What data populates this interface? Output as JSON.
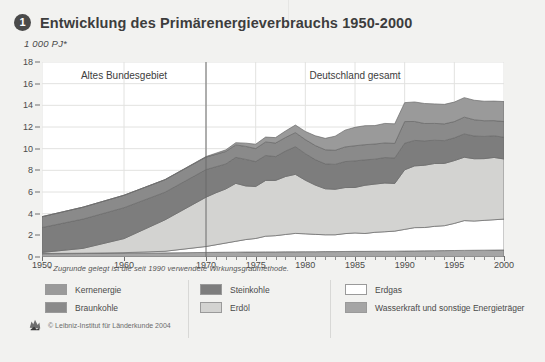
{
  "header": {
    "badge": "1",
    "title": "Entwicklung des Primärenergieverbrauchs 1950-2000",
    "unit": "1 000 PJ*"
  },
  "footnote": "* Zugrunde gelegt ist die seit 1990 verwendete Wirkungsgradmethode.",
  "footer": {
    "copyright": "© Leibniz-Institut für Länderkunde 2004",
    "logo_icon": "leibniz-logo-icon"
  },
  "legend": {
    "columns": [
      {
        "left": 45,
        "items": [
          {
            "label": "Kernenergie",
            "color": "#9a9a9a"
          },
          {
            "label": "Braunkohle",
            "color": "#8a8a8a"
          }
        ]
      },
      {
        "left": 200,
        "items": [
          {
            "label": "Steinkohle",
            "color": "#7d7d7d"
          },
          {
            "label": "Erdöl",
            "color": "#d3d3d1"
          }
        ]
      },
      {
        "left": 345,
        "items": [
          {
            "label": "Erdgas",
            "color": "#ffffff"
          },
          {
            "label": "Wasserkraft und sonstige Energieträger",
            "color": "#a5a5a5"
          }
        ]
      }
    ],
    "divider_x": [
      188,
      330
    ]
  },
  "chart_data": {
    "type": "area",
    "title": "Entwicklung des Primärenergieverbrauchs 1950-2000",
    "subtitle": "",
    "xlabel": "",
    "ylabel": "1 000 PJ*",
    "ylim": [
      0,
      18
    ],
    "ytick_step": 2,
    "yticks": [
      0,
      2,
      4,
      6,
      8,
      10,
      12,
      14,
      16,
      18
    ],
    "grid": true,
    "legend_position": "bottom",
    "stacked": true,
    "annotations": [
      {
        "text": "Altes Bundesgebiet",
        "x": 1960,
        "y": 16.8
      },
      {
        "text": "Deutschland gesamt",
        "x": 1985,
        "y": 16.8
      },
      {
        "text": "divider",
        "x": 1970,
        "type": "vline"
      }
    ],
    "x_axis_note": "piecewise scale: 1950-1970 compressed, 1970-2000 annual ticks",
    "xticks_major": [
      1950,
      1960,
      1970,
      1975,
      1980,
      1985,
      1990,
      1995,
      2000
    ],
    "x": [
      1950,
      1955,
      1960,
      1965,
      1970,
      1971,
      1972,
      1973,
      1974,
      1975,
      1976,
      1977,
      1978,
      1979,
      1980,
      1981,
      1982,
      1983,
      1984,
      1985,
      1986,
      1987,
      1988,
      1989,
      1990,
      1991,
      1992,
      1993,
      1994,
      1995,
      1996,
      1997,
      1998,
      1999,
      2000
    ],
    "series": [
      {
        "name": "Wasserkraft und sonstige Energieträger",
        "color": "#a5a5a5",
        "values": [
          0.3,
          0.32,
          0.35,
          0.38,
          0.42,
          0.43,
          0.44,
          0.45,
          0.46,
          0.46,
          0.47,
          0.47,
          0.48,
          0.48,
          0.49,
          0.49,
          0.5,
          0.5,
          0.51,
          0.52,
          0.52,
          0.53,
          0.53,
          0.54,
          0.55,
          0.56,
          0.57,
          0.58,
          0.59,
          0.6,
          0.61,
          0.62,
          0.63,
          0.64,
          0.65
        ]
      },
      {
        "name": "Erdgas",
        "color": "#ffffff",
        "values": [
          0.02,
          0.03,
          0.05,
          0.15,
          0.55,
          0.7,
          0.85,
          1.0,
          1.15,
          1.25,
          1.45,
          1.5,
          1.6,
          1.7,
          1.65,
          1.6,
          1.55,
          1.55,
          1.65,
          1.7,
          1.65,
          1.75,
          1.8,
          1.85,
          2.0,
          2.15,
          2.15,
          2.25,
          2.3,
          2.5,
          2.75,
          2.7,
          2.75,
          2.8,
          2.85
        ]
      },
      {
        "name": "Erdöl",
        "color": "#d3d3d1",
        "values": [
          0.1,
          0.45,
          1.3,
          2.9,
          4.55,
          4.8,
          5.0,
          5.35,
          4.95,
          4.8,
          5.15,
          5.1,
          5.35,
          5.45,
          4.95,
          4.55,
          4.25,
          4.2,
          4.25,
          4.2,
          4.45,
          4.45,
          4.5,
          4.4,
          5.5,
          5.7,
          5.75,
          5.8,
          5.75,
          5.8,
          5.85,
          5.75,
          5.7,
          5.75,
          5.55
        ]
      },
      {
        "name": "Steinkohle",
        "color": "#7d7d7d",
        "values": [
          2.3,
          2.7,
          2.85,
          2.55,
          2.55,
          2.4,
          2.3,
          2.4,
          2.45,
          2.3,
          2.3,
          2.2,
          2.35,
          2.55,
          2.45,
          2.35,
          2.3,
          2.3,
          2.4,
          2.45,
          2.35,
          2.3,
          2.35,
          2.35,
          2.45,
          2.35,
          2.25,
          2.15,
          2.1,
          2.1,
          2.15,
          2.1,
          2.05,
          2.0,
          2.0
        ]
      },
      {
        "name": "Braunkohle",
        "color": "#8a8a8a",
        "values": [
          1.0,
          1.1,
          1.15,
          1.15,
          1.15,
          1.15,
          1.15,
          1.15,
          1.2,
          1.2,
          1.25,
          1.25,
          1.25,
          1.3,
          1.3,
          1.3,
          1.3,
          1.3,
          1.35,
          1.4,
          1.4,
          1.4,
          1.35,
          1.35,
          2.0,
          1.75,
          1.6,
          1.55,
          1.55,
          1.5,
          1.55,
          1.5,
          1.45,
          1.4,
          1.45
        ]
      },
      {
        "name": "Kernenergie",
        "color": "#9a9a9a",
        "values": [
          0.0,
          0.0,
          0.0,
          0.02,
          0.05,
          0.1,
          0.15,
          0.2,
          0.3,
          0.4,
          0.45,
          0.5,
          0.6,
          0.7,
          0.75,
          0.9,
          1.05,
          1.3,
          1.55,
          1.7,
          1.75,
          1.7,
          1.8,
          1.8,
          1.75,
          1.8,
          1.85,
          1.8,
          1.8,
          1.8,
          1.8,
          1.8,
          1.8,
          1.8,
          1.85
        ]
      }
    ],
    "totals": [
      3.72,
      4.6,
      5.7,
      7.15,
      9.27,
      9.58,
      9.89,
      10.55,
      10.51,
      10.41,
      11.07,
      11.02,
      11.63,
      12.18,
      11.59,
      11.19,
      10.95,
      11.15,
      11.71,
      11.97,
      12.12,
      12.13,
      12.33,
      12.29,
      14.25,
      14.31,
      14.17,
      14.13,
      14.09,
      14.3,
      14.71,
      14.47,
      14.38,
      14.39,
      14.35
    ]
  }
}
